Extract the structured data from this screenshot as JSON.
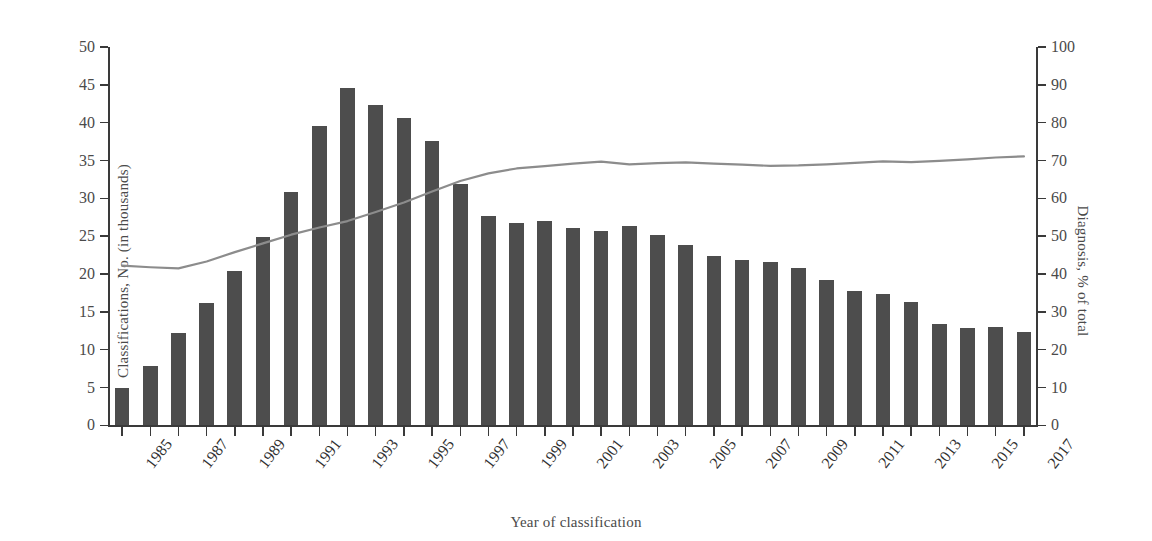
{
  "chart_data": {
    "type": "bar",
    "title": "",
    "subtitle": "",
    "xlabel": "Year of classification",
    "ylabel": "Classifications, No. (in thousands)",
    "ylabel_secondary": "Diagnosis, % of total",
    "grid": false,
    "legend": "none",
    "ylim": [
      0,
      50
    ],
    "ylim_secondary": [
      0,
      100
    ],
    "yticks": [
      0,
      5,
      10,
      15,
      20,
      25,
      30,
      35,
      40,
      45,
      50
    ],
    "yticks_secondary": [
      0,
      10,
      20,
      30,
      40,
      50,
      60,
      70,
      80,
      90,
      100
    ],
    "x": [
      1985,
      1986,
      1987,
      1988,
      1989,
      1990,
      1991,
      1992,
      1993,
      1994,
      1995,
      1996,
      1997,
      1998,
      1999,
      2000,
      2001,
      2002,
      2003,
      2004,
      2005,
      2006,
      2007,
      2008,
      2009,
      2010,
      2011,
      2012,
      2013,
      2014,
      2015,
      2016,
      2017
    ],
    "xtick_labels": [
      "1985",
      "",
      "1987",
      "",
      "1989",
      "",
      "1991",
      "",
      "1993",
      "",
      "1995",
      "",
      "1997",
      "",
      "1999",
      "",
      "2001",
      "",
      "2003",
      "",
      "2005",
      "",
      "2007",
      "",
      "2009",
      "",
      "2011",
      "",
      "2013",
      "",
      "2015",
      "",
      "2017"
    ],
    "series": [
      {
        "name": "Classifications, No. (in thousands)",
        "type": "bar",
        "axis": "left",
        "color": "#4d4d4d",
        "values": [
          4.9,
          7.8,
          12.2,
          16.2,
          20.4,
          24.9,
          30.9,
          39.5,
          44.6,
          42.3,
          40.6,
          37.6,
          31.9,
          27.7,
          26.8,
          27.0,
          26.1,
          25.7,
          26.3,
          25.1,
          23.8,
          22.4,
          21.8,
          21.6,
          20.8,
          19.2,
          17.8,
          17.4,
          16.3,
          13.4,
          12.9,
          13.0,
          12.3
        ]
      },
      {
        "name": "Diagnosis, % of total",
        "type": "line",
        "axis": "right",
        "color": "#8c8c8c",
        "values": [
          42.2,
          41.8,
          41.5,
          43.3,
          45.8,
          48.1,
          50.4,
          52.3,
          54.0,
          56.4,
          58.9,
          61.8,
          64.6,
          66.6,
          67.9,
          68.5,
          69.2,
          69.7,
          69.0,
          69.3,
          69.5,
          69.2,
          68.9,
          68.6,
          68.7,
          69.0,
          69.4,
          69.8,
          69.6,
          69.9,
          70.3,
          70.8,
          71.1
        ]
      }
    ]
  }
}
